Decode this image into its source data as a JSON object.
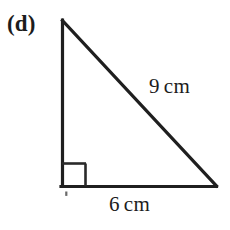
{
  "figure": {
    "part_label": "(d)",
    "shape": "right-triangle",
    "stroke_color": "#1f1f1f",
    "background_color": "#ffffff",
    "stroke_width_px": 3,
    "vertices": {
      "apex": [
        62,
        20
      ],
      "right_angle": [
        62,
        186
      ],
      "base_right": [
        216,
        186
      ]
    },
    "right_angle_marker": {
      "size_px": 22,
      "present": true
    },
    "stray_mark": {
      "x": 66,
      "y": 193,
      "present": true
    }
  },
  "labels": {
    "hypotenuse": {
      "value": "9",
      "unit": "cm",
      "full": "9 cm"
    },
    "base": {
      "value": "6",
      "unit": "cm",
      "full": "6 cm"
    }
  }
}
